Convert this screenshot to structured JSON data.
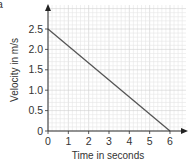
{
  "panel_letter": "a",
  "chart_data": {
    "type": "line",
    "title": "",
    "xlabel": "Time in seconds",
    "ylabel": "Velocity in m/s",
    "x_ticks": [
      "0",
      "1",
      "2",
      "3",
      "4",
      "5",
      "6"
    ],
    "y_ticks": [
      "0",
      "0.5",
      "1.0",
      "1.5",
      "2.0",
      "2.5"
    ],
    "xlim": [
      0,
      6.8
    ],
    "ylim": [
      0,
      3.0
    ],
    "grid": true,
    "series": [
      {
        "name": "velocity",
        "x": [
          0,
          6
        ],
        "y": [
          2.5,
          0
        ]
      }
    ],
    "colors": {
      "line": "#555555",
      "axis": "#333333",
      "grid_minor": "#e6e6e6",
      "grid_major": "#cfcfcf"
    }
  }
}
